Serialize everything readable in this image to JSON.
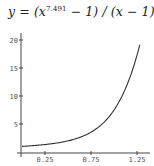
{
  "chart_data": {
    "type": "line",
    "title_parts": {
      "prefix": "y = (x",
      "exponent": "7.491",
      "suffix": " − 1) / (x − 1)"
    },
    "xlabel": "",
    "ylabel": "",
    "x_ticks": [
      "0.25",
      "0.75",
      "1.25"
    ],
    "x_tick_values": [
      0.25,
      0.75,
      1.25
    ],
    "y_ticks": [
      "5",
      "10",
      "15",
      "20"
    ],
    "y_tick_values": [
      5,
      10,
      15,
      20
    ],
    "xlim": [
      0,
      1.3
    ],
    "ylim": [
      0,
      21
    ],
    "grid": false,
    "legend": null,
    "series": [
      {
        "name": "(x^7.491 - 1)/(x - 1)",
        "x": [
          0,
          0.1,
          0.2,
          0.3,
          0.4,
          0.5,
          0.6,
          0.7,
          0.8,
          0.9,
          1.0,
          1.1,
          1.2,
          1.28
        ],
        "y": [
          1.0,
          1.11,
          1.25,
          1.43,
          1.66,
          1.99,
          2.45,
          3.11,
          4.05,
          5.39,
          7.49,
          10.5,
          14.9,
          20.0
        ]
      }
    ]
  }
}
